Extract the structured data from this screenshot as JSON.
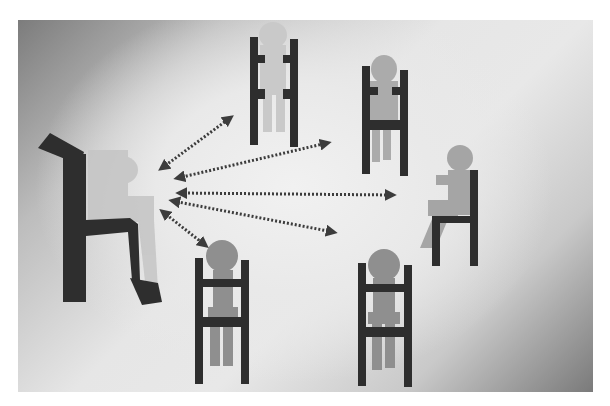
{
  "scene": {
    "description": "Teacher seated on left communicating with five seated students; dotted two-headed arrows between teacher and each student",
    "colors": {
      "chair": "#2e2e2e",
      "teacher_body": "#c4c4c4",
      "student_faded": "#c8c8c8",
      "student_body": "#8f8f8f",
      "student_body_light": "#a3a3a3",
      "arrow": "#3c3c3c",
      "bg_light": "#ececec",
      "bg_dark": "#7c7c7c"
    },
    "figures": [
      {
        "id": "teacher",
        "role": "teacher",
        "posture": "seated-side-view-facing-right"
      },
      {
        "id": "student-top-left",
        "role": "student",
        "posture": "seated-front-view",
        "faded": true
      },
      {
        "id": "student-top-right",
        "role": "student",
        "posture": "seated-front-view"
      },
      {
        "id": "student-right",
        "role": "student",
        "posture": "seated-side-view-facing-left"
      },
      {
        "id": "student-bottom-left",
        "role": "student",
        "posture": "seated-front-view"
      },
      {
        "id": "student-bottom-right",
        "role": "student",
        "posture": "seated-front-view"
      }
    ],
    "arrows": [
      {
        "from": "teacher",
        "to": "student-top-left",
        "x1": 162,
        "y1": 168,
        "x2": 230,
        "y2": 118
      },
      {
        "from": "teacher",
        "to": "student-top-right",
        "x1": 178,
        "y1": 178,
        "x2": 327,
        "y2": 143
      },
      {
        "from": "teacher",
        "to": "student-right",
        "x1": 180,
        "y1": 193,
        "x2": 392,
        "y2": 195
      },
      {
        "from": "teacher",
        "to": "student-bottom-right",
        "x1": 173,
        "y1": 201,
        "x2": 333,
        "y2": 232
      },
      {
        "from": "teacher",
        "to": "student-bottom-left",
        "x1": 163,
        "y1": 212,
        "x2": 205,
        "y2": 245
      }
    ]
  }
}
